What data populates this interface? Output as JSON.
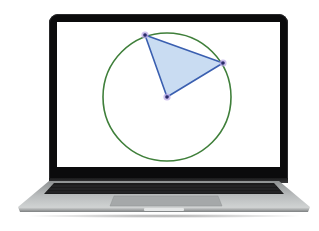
{
  "scene": {
    "description": "Laptop displaying a geometry figure: a circle with an inscribed-angle triangle from the center",
    "device": "laptop"
  },
  "figure": {
    "circle": {
      "center": [
        110,
        75
      ],
      "radius": 64,
      "stroke_color": "#3f7f3a"
    },
    "triangle": {
      "vertices": [
        [
          88,
          13
        ],
        [
          166,
          41
        ],
        [
          110,
          75
        ]
      ],
      "stroke_color": "#3a5fb0",
      "fill_color": "#c9dcf2"
    },
    "points": [
      {
        "label": "",
        "x": 88,
        "y": 13,
        "color": "#2a2a6a",
        "halo": "#b9a6e6"
      },
      {
        "label": "",
        "x": 166,
        "y": 41,
        "color": "#2a2a6a",
        "halo": "#b9a6e6"
      },
      {
        "label": "",
        "x": 110,
        "y": 75,
        "color": "#2a2a6a",
        "halo": "#b9a6e6"
      }
    ]
  },
  "colors": {
    "bezel": "#0b0b0c",
    "screen_bg": "#ffffff",
    "body_silver": "#b9bcbd",
    "keyboard": "#1b1b1c"
  }
}
